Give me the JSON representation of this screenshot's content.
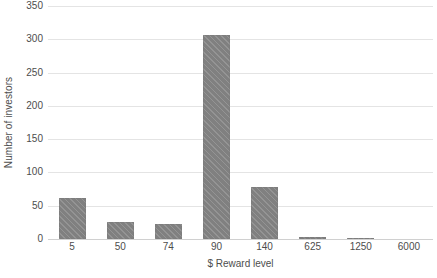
{
  "chart_data": {
    "type": "bar",
    "title": "",
    "subtitle": "",
    "xlabel": "$ Reward level",
    "ylabel": "Number of investors",
    "categories": [
      "5",
      "50",
      "74",
      "90",
      "140",
      "625",
      "1250",
      "6000"
    ],
    "values": [
      62,
      26,
      22,
      306,
      78,
      3,
      2,
      0
    ],
    "ylim": [
      0,
      350
    ],
    "ytick_labels": [
      "0",
      "50",
      "100",
      "150",
      "200",
      "250",
      "300",
      "350"
    ],
    "ytick_values": [
      0,
      50,
      100,
      150,
      200,
      250,
      300,
      350
    ],
    "grid": "horizontal",
    "legend": "none",
    "bar_color": "#808080",
    "gridline_color": "#e4e4e4",
    "text_color": "#4d4d4d",
    "background_color": "#ffffff"
  }
}
